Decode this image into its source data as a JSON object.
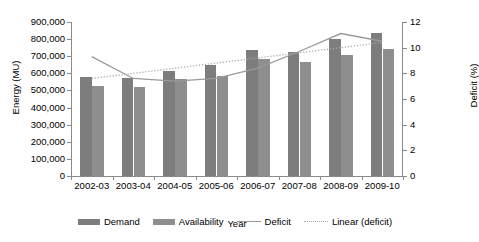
{
  "chart_data": {
    "type": "bar",
    "title": "",
    "xlabel": "Year",
    "ylabel": "Energy (MU)",
    "y2label": "Deficit (%)",
    "categories": [
      "2002-03",
      "2003-04",
      "2004-05",
      "2005-06",
      "2006-07",
      "2007-08",
      "2008-09",
      "2009-10"
    ],
    "ylim": [
      0,
      900000
    ],
    "y2lim": [
      0,
      12
    ],
    "yticks": [
      "0",
      "100,000",
      "200,000",
      "300,000",
      "400,000",
      "500,000",
      "600,000",
      "700,000",
      "800,000",
      "900,000"
    ],
    "ytick_values": [
      0,
      100000,
      200000,
      300000,
      400000,
      500000,
      600000,
      700000,
      800000,
      900000
    ],
    "y2ticks": [
      "0",
      "2",
      "4",
      "6",
      "8",
      "10",
      "12"
    ],
    "y2tick_values": [
      0,
      2,
      4,
      6,
      8,
      10,
      12
    ],
    "grid": false,
    "legend_position": "bottom",
    "series": [
      {
        "name": "Demand",
        "kind": "bar",
        "axis": "left",
        "color": "#7d7d7d",
        "values": [
          580000,
          570000,
          615000,
          650000,
          735000,
          725000,
          800000,
          835000
        ]
      },
      {
        "name": "Availability",
        "kind": "bar",
        "axis": "left",
        "color": "#8e8e8e",
        "values": [
          528000,
          520000,
          565000,
          585000,
          685000,
          665000,
          705000,
          745000
        ]
      },
      {
        "name": "Deficit",
        "kind": "line",
        "axis": "right",
        "color": "#9a9a9a",
        "style": "solid",
        "values": [
          9.3,
          7.6,
          7.4,
          7.6,
          8.4,
          9.7,
          11.1,
          10.5
        ]
      },
      {
        "name": "Linear (deficit)",
        "kind": "line",
        "axis": "right",
        "color": "#a8a8a8",
        "style": "dotted",
        "values": [
          7.6,
          8.0,
          8.4,
          8.8,
          9.2,
          9.6,
          10.0,
          10.4
        ]
      }
    ]
  },
  "legend": {
    "items": [
      {
        "label": "Demand",
        "marker": "bar-swatch-demand"
      },
      {
        "label": "Availability",
        "marker": "bar-swatch-availability"
      },
      {
        "label": "Deficit",
        "marker": "line-swatch-solid"
      },
      {
        "label": "Linear (deficit)",
        "marker": "line-swatch-dotted"
      }
    ]
  }
}
